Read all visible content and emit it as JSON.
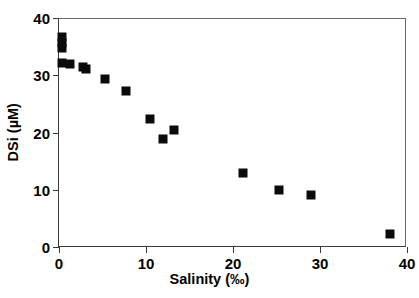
{
  "chart_data": {
    "type": "scatter",
    "title": "",
    "xlabel": "Salinity (‰)",
    "ylabel": "DSi (µM)",
    "xlim": [
      0,
      40
    ],
    "ylim": [
      0,
      40
    ],
    "xticks": [
      "0",
      "10",
      "20",
      "30",
      "40"
    ],
    "xtick_values": [
      0,
      10,
      20,
      30,
      40
    ],
    "yticks": [
      "0",
      "10",
      "20",
      "30",
      "40"
    ],
    "ytick_values": [
      0,
      10,
      20,
      30,
      40
    ],
    "grid": false,
    "legend": null,
    "marker": {
      "shape": "square",
      "color": "#0b0b0b",
      "size_px": 9
    },
    "series": [
      {
        "name": "DSi vs Salinity",
        "points": [
          {
            "x": 0.3,
            "y": 36.6
          },
          {
            "x": 0.3,
            "y": 35.6
          },
          {
            "x": 0.3,
            "y": 34.7
          },
          {
            "x": 0.4,
            "y": 32.1
          },
          {
            "x": 1.3,
            "y": 32.0
          },
          {
            "x": 2.8,
            "y": 31.5
          },
          {
            "x": 3.1,
            "y": 31.1
          },
          {
            "x": 5.3,
            "y": 29.4
          },
          {
            "x": 7.7,
            "y": 27.3
          },
          {
            "x": 10.5,
            "y": 22.3
          },
          {
            "x": 11.9,
            "y": 18.9
          },
          {
            "x": 13.2,
            "y": 20.4
          },
          {
            "x": 21.2,
            "y": 12.9
          },
          {
            "x": 25.3,
            "y": 10.0
          },
          {
            "x": 29.0,
            "y": 9.0
          },
          {
            "x": 38.0,
            "y": 2.3
          }
        ]
      }
    ]
  },
  "colors": {
    "marker": "#0b0b0b",
    "axis": "#3a3a3a",
    "frame": "#6a6a6a",
    "background": "#ffffff",
    "text": "#000000"
  }
}
